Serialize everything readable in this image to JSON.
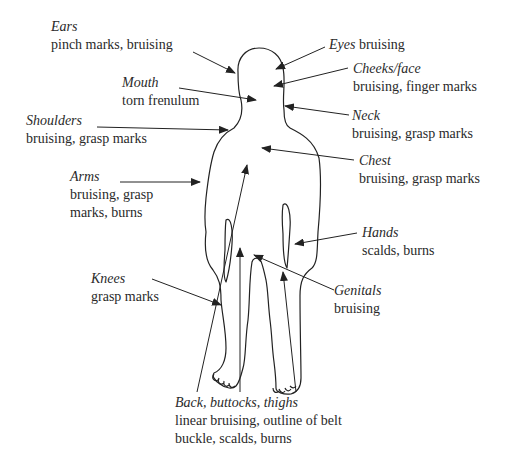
{
  "diagram": {
    "stroke_color": "#222222",
    "text_color": "#2a2a2a",
    "annotations": [
      {
        "id": "ears",
        "region": "Ears",
        "injuries": "pinch marks, bruising"
      },
      {
        "id": "eyes",
        "region": "Eyes",
        "injuries": "bruising"
      },
      {
        "id": "cheeks",
        "region": "Cheeks/face",
        "injuries": "bruising, finger marks"
      },
      {
        "id": "mouth",
        "region": "Mouth",
        "injuries": "torn frenulum"
      },
      {
        "id": "neck",
        "region": "Neck",
        "injuries": "bruising, grasp marks"
      },
      {
        "id": "shoulders",
        "region": "Shoulders",
        "injuries": "bruising, grasp marks"
      },
      {
        "id": "chest",
        "region": "Chest",
        "injuries": "bruising, grasp marks"
      },
      {
        "id": "arms",
        "region": "Arms",
        "injuries_line1": "bruising, grasp",
        "injuries_line2": "marks, burns"
      },
      {
        "id": "hands",
        "region": "Hands",
        "injuries": "scalds, burns"
      },
      {
        "id": "knees",
        "region": "Knees",
        "injuries": "grasp marks"
      },
      {
        "id": "genitals",
        "region": "Genitals",
        "injuries": "bruising"
      },
      {
        "id": "back",
        "region": "Back, buttocks, thighs",
        "injuries_line1": "linear bruising, outline of belt",
        "injuries_line2": "buckle, scalds, burns"
      }
    ]
  }
}
